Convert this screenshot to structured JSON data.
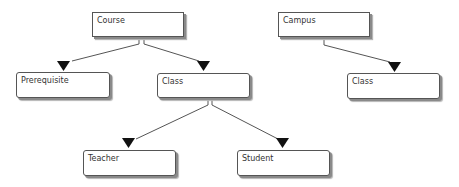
{
  "nodes": [
    {
      "id": "course",
      "label": "Course",
      "x": 92,
      "y": 12,
      "w": 92,
      "h": 25
    },
    {
      "id": "prerequisite",
      "label": "Prerequisite",
      "x": 16,
      "y": 72,
      "w": 94,
      "h": 26
    },
    {
      "id": "class_left",
      "label": "Class",
      "x": 157,
      "y": 73,
      "w": 93,
      "h": 25
    },
    {
      "id": "campus",
      "label": "Campus",
      "x": 278,
      "y": 12,
      "w": 92,
      "h": 25
    },
    {
      "id": "class_right",
      "label": "Class",
      "x": 347,
      "y": 73,
      "w": 93,
      "h": 26
    },
    {
      "id": "teacher",
      "label": "Teacher",
      "x": 83,
      "y": 150,
      "w": 93,
      "h": 26
    },
    {
      "id": "student",
      "label": "Student",
      "x": 237,
      "y": 150,
      "w": 93,
      "h": 26
    }
  ],
  "edges": [
    {
      "from": "course",
      "to": "prerequisite"
    },
    {
      "from": "course",
      "to": "class_left"
    },
    {
      "from": "class_left",
      "to": "teacher"
    },
    {
      "from": "class_left",
      "to": "student"
    },
    {
      "from": "campus",
      "to": "class_right"
    }
  ],
  "colors": {
    "line": "#555555",
    "arrow": "#111111",
    "shadow": "#8a8a8a"
  }
}
